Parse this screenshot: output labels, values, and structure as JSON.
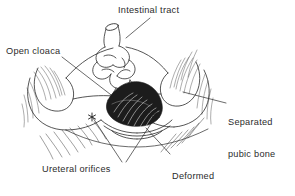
{
  "figure": {
    "type": "anatomical-line-drawing",
    "background_color": "#ffffff",
    "ink_color": "#2b2b2b"
  },
  "labels": {
    "intestinal_tract": "Intestinal tract",
    "open_cloaca": "Open cloaca",
    "separated_pubic_bone_line1": "Separated",
    "separated_pubic_bone_line2": "pubic bone",
    "ureteral_orifices": "Ureteral orifices",
    "phallus_line1": "Deformed",
    "phallus_line2": "(splayed)",
    "phallus_line3": "phallus"
  },
  "markers": {
    "asterisk": "*",
    "count": 2,
    "meaning": "ureteral orifices"
  }
}
